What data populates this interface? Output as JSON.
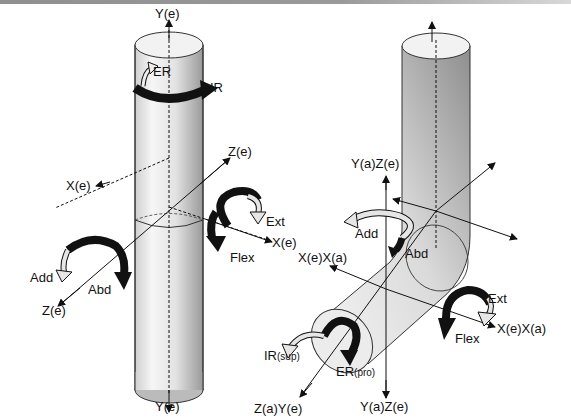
{
  "figure": {
    "left_panel": {
      "name": "elbow extended cylinder",
      "labels": {
        "y_top": "Y(e)",
        "y_bottom": "Y(e)",
        "z_top": "Z(e)",
        "z_bottom": "Z(e)",
        "x_left": "X(e)",
        "x_right": "X(e)",
        "er": "ER",
        "ir": "IR",
        "ext": "Ext",
        "flex": "Flex",
        "add": "Add",
        "abd": "Abd"
      }
    },
    "right_panel": {
      "name": "elbow flexed bent cylinder",
      "labels": {
        "ya_ze_top": "Y(a)Z(e)",
        "ya_ze_bottom": "Y(a)Z(e)",
        "xe_xa_left": "X(e)X(a)",
        "xe_xa_right": "X(e)X(a)",
        "za_ye": "Z(a)Y(e)",
        "add": "Add",
        "abd": "Abd",
        "ext": "Ext",
        "flex": "Flex",
        "ir_sup_main": "IR",
        "ir_sup_sub": "(sup)",
        "er_pro_main": "ER",
        "er_pro_sub": "(pro)"
      }
    },
    "colors": {
      "cylinder_light": "#f4f4f4",
      "cylinder_dark": "#9c9c9c",
      "arrow_black": "#111111",
      "arrow_hollow": "#e6e6e6",
      "axis": "#111111"
    }
  }
}
